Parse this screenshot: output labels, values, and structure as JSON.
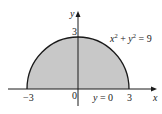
{
  "diagram": {
    "type": "region-plot",
    "axes": {
      "x_label": "x",
      "y_label": "y",
      "origin_label": "0",
      "x_ticks": [
        "-3",
        "3"
      ],
      "y_ticks": [
        "3"
      ]
    },
    "curves": [
      {
        "name": "circle",
        "equation_lhs": "x",
        "equation_text": "x² + y² = 9",
        "x_sup": "2",
        "y_sup": "2",
        "rhs": "9"
      },
      {
        "name": "baseline",
        "equation_text": "y = 0"
      }
    ],
    "labels": {
      "circle_eq_x": "x",
      "circle_eq_sup1": "2",
      "circle_eq_plus": " + ",
      "circle_eq_y": "y",
      "circle_eq_sup2": "2",
      "circle_eq_rest": " = 9",
      "line_eq_y": "y",
      "line_eq_rest": " = 0",
      "tick_neg3": "−3",
      "tick_pos3": "3",
      "tick_y3": "3",
      "origin": "0",
      "axis_x": "x",
      "axis_y": "y"
    },
    "colors": {
      "fill": "#c8c8c8",
      "stroke": "#1a1a1a",
      "background": "#ffffff"
    }
  }
}
